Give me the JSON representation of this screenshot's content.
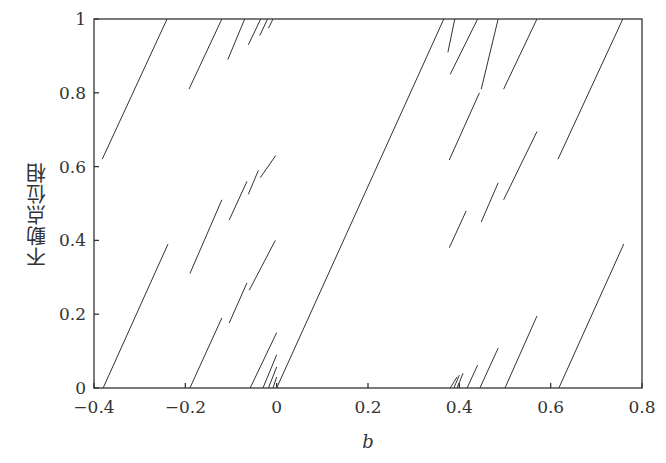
{
  "chart_data": {
    "type": "line",
    "title": "",
    "xlabel": "b",
    "ylabel": "不動点位相",
    "xlim": [
      -0.4,
      0.8
    ],
    "ylim": [
      0,
      1
    ],
    "xticks": [
      -0.4,
      -0.2,
      0,
      0.2,
      0.4,
      0.6,
      0.8
    ],
    "xtick_labels": [
      "−0.4",
      "−0.2",
      "0",
      "0.2",
      "0.4",
      "0.6",
      "0.8"
    ],
    "yticks": [
      0,
      0.2,
      0.4,
      0.6,
      0.8,
      1
    ],
    "ytick_labels": [
      "0",
      "0.2",
      "0.4",
      "0.6",
      "0.8",
      "1"
    ],
    "grid": false,
    "legend": null,
    "segments": [
      {
        "x": [
          -0.382,
          -0.24
        ],
        "y": [
          0.62,
          1.0
        ]
      },
      {
        "x": [
          -0.38,
          -0.238
        ],
        "y": [
          0.0,
          0.39
        ]
      },
      {
        "x": [
          -0.192,
          -0.12
        ],
        "y": [
          0.81,
          1.0
        ]
      },
      {
        "x": [
          -0.19,
          -0.12
        ],
        "y": [
          0.31,
          0.51
        ]
      },
      {
        "x": [
          -0.19,
          -0.12
        ],
        "y": [
          0.0,
          0.19
        ]
      },
      {
        "x": [
          -0.107,
          -0.07
        ],
        "y": [
          0.89,
          1.0
        ]
      },
      {
        "x": [
          -0.104,
          -0.065
        ],
        "y": [
          0.455,
          0.56
        ]
      },
      {
        "x": [
          -0.104,
          -0.065
        ],
        "y": [
          0.176,
          0.285
        ]
      },
      {
        "x": [
          -0.062,
          -0.035
        ],
        "y": [
          0.93,
          1.0
        ]
      },
      {
        "x": [
          -0.062,
          -0.04
        ],
        "y": [
          0.525,
          0.59
        ]
      },
      {
        "x": [
          -0.06,
          -0.003
        ],
        "y": [
          0.265,
          0.4
        ]
      },
      {
        "x": [
          -0.058,
          0.0
        ],
        "y": [
          0.0,
          0.15
        ]
      },
      {
        "x": [
          -0.037,
          -0.02
        ],
        "y": [
          0.955,
          1.0
        ]
      },
      {
        "x": [
          -0.036,
          -0.002
        ],
        "y": [
          0.57,
          0.63
        ]
      },
      {
        "x": [
          -0.03,
          0.0
        ],
        "y": [
          0.0,
          0.09
        ]
      },
      {
        "x": [
          -0.018,
          -0.008
        ],
        "y": [
          0.975,
          1.0
        ]
      },
      {
        "x": [
          -0.018,
          0.0
        ],
        "y": [
          0.0,
          0.057
        ]
      },
      {
        "x": [
          -0.008,
          0.0
        ],
        "y": [
          0.0,
          0.03
        ]
      },
      {
        "x": [
          0.0,
          0.366
        ],
        "y": [
          0.0,
          1.0
        ]
      },
      {
        "x": [
          0.375,
          0.39
        ],
        "y": [
          0.91,
          1.0
        ]
      },
      {
        "x": [
          0.38,
          0.44
        ],
        "y": [
          0.85,
          1.0
        ]
      },
      {
        "x": [
          0.378,
          0.444
        ],
        "y": [
          0.618,
          0.8
        ]
      },
      {
        "x": [
          0.378,
          0.415
        ],
        "y": [
          0.38,
          0.48
        ]
      },
      {
        "x": [
          0.38,
          0.395
        ],
        "y": [
          0.0,
          0.03
        ]
      },
      {
        "x": [
          0.388,
          0.4
        ],
        "y": [
          0.0,
          0.035
        ]
      },
      {
        "x": [
          0.395,
          0.408
        ],
        "y": [
          0.0,
          0.04
        ]
      },
      {
        "x": [
          0.417,
          0.44
        ],
        "y": [
          0.0,
          0.062
        ]
      },
      {
        "x": [
          0.448,
          0.485
        ],
        "y": [
          0.45,
          0.556
        ]
      },
      {
        "x": [
          0.448,
          0.485
        ],
        "y": [
          0.81,
          1.0
        ]
      },
      {
        "x": [
          0.445,
          0.485
        ],
        "y": [
          0.0,
          0.108
        ]
      },
      {
        "x": [
          0.497,
          0.57
        ],
        "y": [
          0.81,
          1.0
        ]
      },
      {
        "x": [
          0.497,
          0.57
        ],
        "y": [
          0.51,
          0.695
        ]
      },
      {
        "x": [
          0.5,
          0.57
        ],
        "y": [
          0.0,
          0.195
        ]
      },
      {
        "x": [
          0.616,
          0.758
        ],
        "y": [
          0.62,
          1.0
        ]
      },
      {
        "x": [
          0.618,
          0.76
        ],
        "y": [
          0.0,
          0.39
        ]
      }
    ]
  },
  "axes": {
    "xlabel": "b",
    "ylabel": "不動点位相"
  }
}
